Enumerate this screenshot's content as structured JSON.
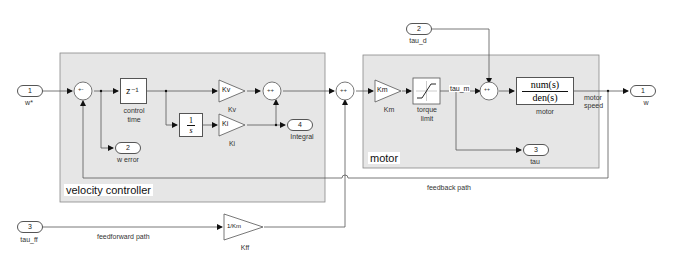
{
  "diagram": {
    "areas": {
      "velocity_controller": {
        "title": "velocity controller"
      },
      "motor": {
        "title": "motor"
      }
    },
    "inports": [
      {
        "id": "w_star",
        "number": "1",
        "label": "w*"
      },
      {
        "id": "tau_d",
        "number": "2",
        "label": "tau_d"
      },
      {
        "id": "tau_ff",
        "number": "3",
        "label": "tau_ff"
      }
    ],
    "outports": [
      {
        "id": "w",
        "number": "1",
        "label": "w"
      },
      {
        "id": "w_error",
        "number": "2",
        "label": "w error"
      },
      {
        "id": "tau",
        "number": "3",
        "label": "tau"
      },
      {
        "id": "integral",
        "number": "4",
        "label": "Integral"
      }
    ],
    "blocks": {
      "sum_error": {
        "signs": "+-"
      },
      "delay": {
        "content": "z⁻¹",
        "label_line1": "control",
        "label_line2": "time"
      },
      "integrator": {
        "num": "1",
        "den": "s"
      },
      "kv": {
        "content": "Kv",
        "label": "Kv"
      },
      "ki": {
        "content": "Ki",
        "label": "Ki"
      },
      "sum_pi": {
        "signs": "++"
      },
      "sum_ff": {
        "signs": "++"
      },
      "km": {
        "content": "Km",
        "label": "Km"
      },
      "torque_limit": {
        "label_line1": "torque",
        "label_line2": "limit"
      },
      "sum_dist": {
        "signs": "++"
      },
      "motor_tf": {
        "num": "num(s)",
        "den": "den(s)",
        "label": "motor"
      },
      "kff": {
        "content": "1/Km",
        "label": "Kff"
      }
    },
    "signals": {
      "tau_m": "tau_m",
      "motor_speed_line1": "motor",
      "motor_speed_line2": "speed",
      "feedback": "feedback path",
      "feedforward": "feedforward path"
    }
  }
}
